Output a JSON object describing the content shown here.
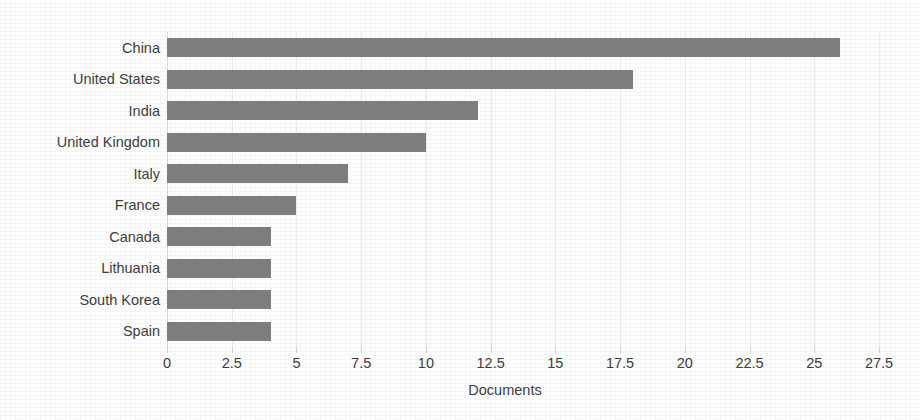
{
  "chart_data": {
    "type": "bar",
    "orientation": "horizontal",
    "title": "",
    "subtitle": "",
    "xlabel": "Documents",
    "ylabel": "",
    "categories": [
      "China",
      "United States",
      "India",
      "United Kingdom",
      "Italy",
      "France",
      "Canada",
      "Lithuania",
      "South Korea",
      "Spain"
    ],
    "values": [
      26,
      18,
      12,
      10,
      7,
      5,
      4,
      4,
      4,
      4
    ],
    "series": [
      {
        "name": "Documents",
        "values": [
          26,
          18,
          12,
          10,
          7,
          5,
          4,
          4,
          4,
          4
        ]
      }
    ],
    "xlim": [
      0,
      27.5
    ],
    "xticks": [
      0,
      2.5,
      5,
      7.5,
      10,
      12.5,
      15,
      17.5,
      20,
      22.5,
      25,
      27.5
    ],
    "xtick_labels": [
      "0",
      "2.5",
      "5",
      "7.5",
      "10",
      "12.5",
      "15",
      "17.5",
      "20",
      "22.5",
      "25",
      "27.5"
    ],
    "grid": "vertical",
    "legend": "none",
    "annotations": [],
    "colors": {
      "bar": "#7d7d7d",
      "gridline": "#e9e9e9",
      "text": "#3d3d3d",
      "background": "#ffffff"
    }
  }
}
